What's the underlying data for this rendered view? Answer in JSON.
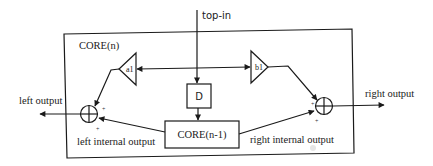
{
  "diagram": {
    "labels": {
      "top_in": "top-in",
      "core_n": "CORE(n)",
      "core_n_minus_1": "CORE(n-1)",
      "delay": "D",
      "gain_a1": "a1",
      "gain_b1": "b1",
      "left_output": "left output",
      "right_output": "right output",
      "left_internal_output": "left internal output",
      "right_internal_output": "right internal output",
      "plus": "+"
    },
    "nodes": [
      {
        "id": "core_n",
        "type": "container",
        "label": "CORE(n)"
      },
      {
        "id": "delay",
        "type": "block",
        "label": "D"
      },
      {
        "id": "core_n_minus_1",
        "type": "block",
        "label": "CORE(n-1)"
      },
      {
        "id": "a1",
        "type": "gain",
        "label": "a1",
        "direction": "left"
      },
      {
        "id": "b1",
        "type": "gain",
        "label": "b1",
        "direction": "right"
      },
      {
        "id": "left_sum",
        "type": "summer"
      },
      {
        "id": "right_sum",
        "type": "summer"
      }
    ],
    "edges": [
      {
        "from": "top-in",
        "to": "delay"
      },
      {
        "from": "delay",
        "to": "core_n_minus_1"
      },
      {
        "from": "top-in",
        "to": "a1"
      },
      {
        "from": "top-in",
        "to": "b1"
      },
      {
        "from": "a1",
        "to": "left_sum",
        "sign": "+"
      },
      {
        "from": "core_n_minus_1",
        "to": "left_sum",
        "label": "left internal output",
        "sign": "+"
      },
      {
        "from": "b1",
        "to": "right_sum",
        "sign": "+"
      },
      {
        "from": "core_n_minus_1",
        "to": "right_sum",
        "label": "right internal output",
        "sign": "+"
      },
      {
        "from": "left_sum",
        "to": "left output"
      },
      {
        "from": "right_sum",
        "to": "right output"
      }
    ]
  }
}
